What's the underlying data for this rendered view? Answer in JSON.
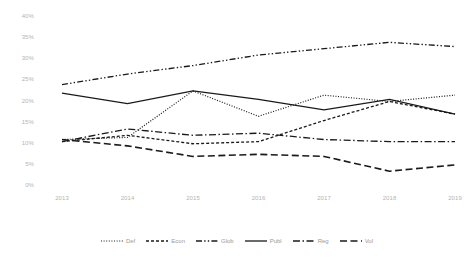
{
  "chart_data": {
    "type": "line",
    "title": "",
    "subtitle": "",
    "xlabel": "",
    "ylabel": "",
    "x": [
      "2013",
      "2014",
      "2015",
      "2016",
      "2017",
      "2018",
      "2019"
    ],
    "categories": [
      "2013",
      "2014",
      "2015",
      "2016",
      "2017",
      "2018",
      "2019"
    ],
    "ylim": [
      0,
      40
    ],
    "ytick_values": [
      0,
      5,
      10,
      15,
      20,
      25,
      30,
      35,
      40
    ],
    "ytick_labels": [
      "0%",
      "5%",
      "10%",
      "15%",
      "20%",
      "25%",
      "30%",
      "35%",
      "40%"
    ],
    "grid": false,
    "legend_position": "bottom",
    "line_color": "#1a1a1a",
    "axis_label_color": "#b4b4b4",
    "legend_label_color": "#9a9a9a",
    "series": [
      {
        "name": "Def",
        "dash": "dotted",
        "values": [
          11.0,
          11.5,
          22.5,
          16.5,
          21.5,
          20.0,
          21.5
        ]
      },
      {
        "name": "Econ",
        "dash": "dashed-short",
        "values": [
          10.5,
          12.0,
          10.0,
          10.5,
          15.5,
          20.0,
          17.0
        ]
      },
      {
        "name": "Glob",
        "dash": "dash-dot-dot",
        "values": [
          24.0,
          26.5,
          28.5,
          31.0,
          32.5,
          34.0,
          33.0
        ]
      },
      {
        "name": "Publ",
        "dash": "solid",
        "values": [
          22.0,
          19.5,
          22.5,
          20.5,
          18.0,
          20.5,
          17.0
        ]
      },
      {
        "name": "Reg",
        "dash": "dash-dot",
        "values": [
          10.5,
          13.5,
          12.0,
          12.5,
          11.0,
          10.5,
          10.5
        ]
      },
      {
        "name": "Vol",
        "dash": "dashed-long",
        "values": [
          11.0,
          9.5,
          7.0,
          7.5,
          7.0,
          3.5,
          5.0
        ]
      }
    ]
  },
  "legend": {
    "items": [
      {
        "label": "Def"
      },
      {
        "label": "Econ"
      },
      {
        "label": "Glob"
      },
      {
        "label": "Publ"
      },
      {
        "label": "Reg"
      },
      {
        "label": "Vol"
      }
    ]
  }
}
